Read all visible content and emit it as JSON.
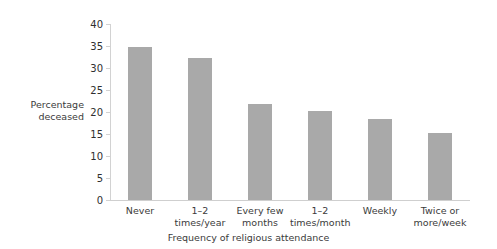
{
  "chart_data": {
    "type": "bar",
    "title": "",
    "subtitle": "",
    "xlabel": "Frequency of religious attendance",
    "ylabel": "Percentage deceased",
    "categories": [
      "Never",
      "1–2\ntimes/year",
      "Every few\nmonths",
      "1–2\ntimes/month",
      "Weekly",
      "Twice or\nmore/week"
    ],
    "values": [
      34.8,
      32.3,
      21.8,
      20.2,
      18.3,
      15.2
    ],
    "ylim": [
      0,
      40
    ],
    "yticks": [
      "0",
      "5",
      "10",
      "15",
      "20",
      "25",
      "30",
      "35",
      "40"
    ],
    "ytick_values": [
      0,
      5,
      10,
      15,
      20,
      25,
      30,
      35,
      40
    ],
    "grid": false,
    "legend": "none",
    "bar_color": "#a9a9a9",
    "axis_color": "#d2d2d2",
    "text_color": "#3b3b3b",
    "background": "#ffffff"
  }
}
